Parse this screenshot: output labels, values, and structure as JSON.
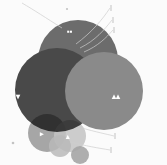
{
  "figure": {
    "title": "",
    "background_color": "#fbfbfb"
  },
  "chart_data": {
    "type": "venn",
    "title": "",
    "xlabel": "",
    "ylabel": "",
    "legend_position": "none",
    "grid": false,
    "blend_mode": "multiply",
    "sets": [
      {
        "name": "set-top",
        "label": "▪▪",
        "color": "#6e6e6e",
        "cx": 78,
        "cy": 60,
        "r": 40,
        "label_x": 67,
        "label_y": 34,
        "label_color": "#ffffff"
      },
      {
        "name": "set-left",
        "label": "▾",
        "color": "#4a4a4a",
        "cx": 57,
        "cy": 90,
        "r": 42,
        "label_x": 16,
        "label_y": 99,
        "label_color": "#ffffff"
      },
      {
        "name": "set-right",
        "label": "▴▴",
        "color": "#8c8c8c",
        "cx": 104,
        "cy": 91,
        "r": 39,
        "label_x": 112,
        "label_y": 99,
        "label_color": "#ffffff"
      }
    ],
    "satellites": [
      {
        "name": "satellite-left",
        "label": "▸",
        "color": "#9a9a9a",
        "cx": 47,
        "cy": 133,
        "r": 19,
        "label_x": 40,
        "label_y": 136,
        "label_color": "#ffffff"
      },
      {
        "name": "satellite-center",
        "label": "▴",
        "color": "#c8c8c8",
        "cx": 70,
        "cy": 136,
        "r": 16,
        "label_x": 66,
        "label_y": 139,
        "label_color": "#ffffff"
      },
      {
        "name": "satellite-small",
        "label": "",
        "color": "#bdbdbd",
        "cx": 60,
        "cy": 146,
        "r": 11,
        "label_x": 0,
        "label_y": 0,
        "label_color": "#ffffff"
      },
      {
        "name": "satellite-far",
        "label": "",
        "color": "#a8a8a8",
        "cx": 80,
        "cy": 155,
        "r": 9,
        "label_x": 0,
        "label_y": 0,
        "label_color": "#ffffff"
      }
    ],
    "leaders": [
      {
        "name": "leader-top-left",
        "path": "M 62 28 C 46 18, 34 10, 22 3"
      },
      {
        "name": "leader-top-right-1",
        "path": "M 76 44 C 92 32, 102 20, 110 8"
      },
      {
        "name": "leader-top-right-2",
        "path": "M 80 48 C 96 40, 104 30, 112 20"
      },
      {
        "name": "leader-top-right-3",
        "path": "M 84 52 C 98 46, 106 38, 113 30"
      },
      {
        "name": "leader-bottom-right-1",
        "path": "M 82 128 C 96 132, 106 134, 114 136"
      },
      {
        "name": "leader-bottom-right-2",
        "path": "M 70 142 C 86 146, 98 148, 110 150"
      }
    ],
    "tick_markers": [
      {
        "name": "tick-top-right-1",
        "x": 111,
        "y": 8
      },
      {
        "name": "tick-top-right-2",
        "x": 113,
        "y": 20
      },
      {
        "name": "tick-top-right-3",
        "x": 114,
        "y": 30
      },
      {
        "name": "tick-bottom-right-1",
        "x": 115,
        "y": 136
      },
      {
        "name": "tick-bottom-right-2",
        "x": 111,
        "y": 150
      }
    ],
    "dot_markers": [
      {
        "name": "dot-top-center",
        "x": 67,
        "y": 9,
        "r": 1.1
      },
      {
        "name": "dot-left-bottom",
        "x": 13,
        "y": 143,
        "r": 1.3
      }
    ]
  }
}
